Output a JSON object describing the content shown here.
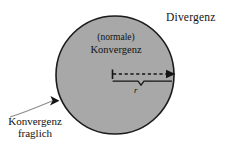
{
  "figure": {
    "background_color": "#ffffff",
    "disc_fill_color": "#a8a8a8",
    "disc_stroke_color": "#1a1a1a",
    "text_color": "#111111"
  },
  "labels": {
    "divergenz": "Divergenz",
    "konvergenz_center_line1": "(normale)",
    "konvergenz_center_line2": "Konvergenz",
    "konvergenz_fraglich_line1": "Konvergenz",
    "konvergenz_fraglich_line2": "fraglich",
    "radius": "r"
  },
  "geometry": {
    "disc_center_x": 115,
    "disc_center_y": 75,
    "disc_radius": 59,
    "radius_arrow_start_x": 112,
    "radius_arrow_end_x": 174,
    "radius_arrow_y": 74,
    "brace_y": 81,
    "leader_arrow_tip_x": 58,
    "leader_arrow_tip_y": 101
  }
}
